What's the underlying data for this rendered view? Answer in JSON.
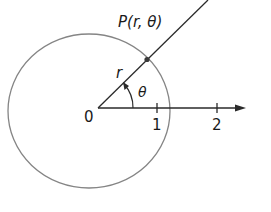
{
  "diagram": {
    "type": "polar-coordinates",
    "origin_label": "0",
    "point_label": "P(r, θ)",
    "radius_label": "r",
    "angle_label": "θ",
    "axis_ticks": [
      {
        "value": 1,
        "label": "1"
      },
      {
        "value": 2,
        "label": "2"
      }
    ],
    "colors": {
      "circle": "#808080",
      "lines": "#2a2a2a",
      "text": "#1a1a1a"
    }
  }
}
